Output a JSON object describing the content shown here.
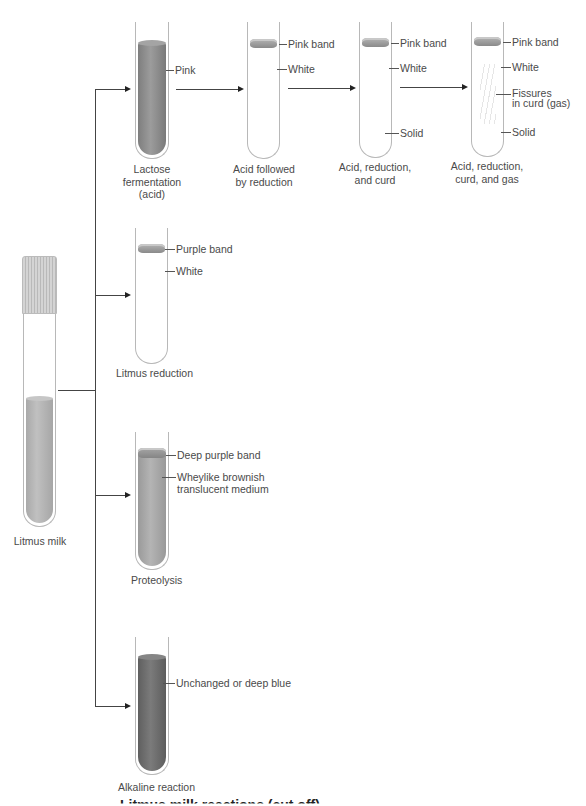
{
  "diagram": {
    "type": "flow",
    "source": {
      "label": "Litmus milk"
    },
    "branches": [
      {
        "caption": "Lactose fermentation (acid)",
        "caption_lines": [
          "Lactose",
          "fermentation",
          "(acid)"
        ],
        "annotations": [
          "Pink"
        ]
      },
      {
        "caption": "Litmus reduction",
        "annotations": [
          "Purple band",
          "White"
        ]
      },
      {
        "caption": "Proteolysis",
        "annotations": [
          "Deep purple band",
          "Wheylike brownish translucent medium"
        ],
        "annotation_lines": [
          "Wheylike brownish",
          "translucent medium"
        ]
      },
      {
        "caption": "Alkaline reaction",
        "annotations": [
          "Unchanged or deep blue"
        ]
      }
    ],
    "fermentation_sequence": [
      {
        "caption_lines": [
          "Acid followed",
          "by reduction"
        ],
        "annotations": [
          "Pink band",
          "White"
        ]
      },
      {
        "caption_lines": [
          "Acid, reduction,",
          "and curd"
        ],
        "annotations": [
          "Pink band",
          "White",
          "Solid"
        ]
      },
      {
        "caption_lines": [
          "Acid, reduction,",
          "curd, and gas"
        ],
        "annotations": [
          "Pink band",
          "White",
          "Fissures in curd (gas)",
          "Solid"
        ],
        "fissure_lines": [
          "Fissures",
          "in curd (gas)"
        ]
      }
    ],
    "figure_caption_visible": "Litmus milk reactions (cut off)",
    "colors": {
      "line": "#444444",
      "glass": "#b8b8b8",
      "pink_fill": "#8f8f8f",
      "proteolysis_fill": "#a2a2a2",
      "alkaline_fill": "#6e6e6e",
      "band": "#9a9a9a",
      "cap": "#c8c8c8"
    }
  }
}
